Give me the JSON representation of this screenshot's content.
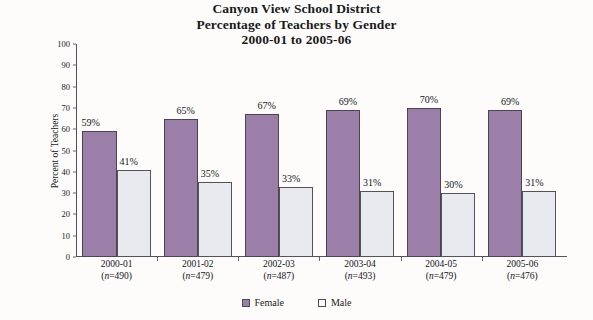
{
  "chart_data": {
    "type": "bar",
    "title": "Canyon View School District\nPercentage of Teachers by Gender\n2000-01 to 2005-06",
    "title_lines": [
      "Canyon View School District",
      "Percentage of  Teachers by Gender",
      "2000-01 to 2005-06"
    ],
    "xlabel": "",
    "ylabel": "Percent of Teachers",
    "ylim": [
      0,
      100
    ],
    "ytick_step": 10,
    "yticks": [
      0,
      10,
      20,
      30,
      40,
      50,
      60,
      70,
      80,
      90,
      100
    ],
    "grid": false,
    "legend_position": "bottom-center",
    "categories": [
      "2000-01",
      "2001-02",
      "2002-03",
      "2003-04",
      "2004-05",
      "2005-06"
    ],
    "category_sublabels": [
      "(n=490)",
      "(n=479)",
      "(n=487)",
      "(n=493)",
      "(n=479)",
      "(n=476)"
    ],
    "category_n": [
      490,
      479,
      487,
      493,
      479,
      476
    ],
    "series": [
      {
        "name": "Female",
        "color": "#9b7fa9",
        "values": [
          59,
          65,
          67,
          69,
          70,
          69
        ],
        "value_labels": [
          "59%",
          "65%",
          "67%",
          "69%",
          "70%",
          "69%"
        ]
      },
      {
        "name": "Male",
        "color": "#e8eaf0",
        "values": [
          41,
          35,
          33,
          31,
          30,
          31
        ],
        "value_labels": [
          "41%",
          "35%",
          "33%",
          "31%",
          "30%",
          "31%"
        ]
      }
    ]
  },
  "legend": {
    "items": [
      {
        "label": "Female",
        "swatch": "female"
      },
      {
        "label": "Male",
        "swatch": "male"
      }
    ]
  }
}
